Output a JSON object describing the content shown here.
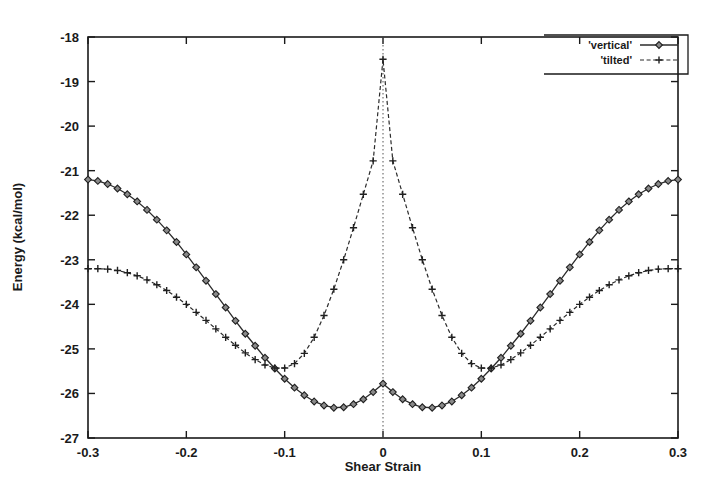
{
  "chart_data": {
    "type": "line",
    "title": "",
    "xlabel": "Shear Strain",
    "ylabel": "Energy (kcal/mol)",
    "xlim": [
      -0.3,
      0.3
    ],
    "ylim": [
      -27,
      -18
    ],
    "xticks": [
      -0.3,
      -0.2,
      -0.1,
      0,
      0.1,
      0.2,
      0.3
    ],
    "xtick_labels": [
      "-0.3",
      "-0.2",
      "-0.1",
      "0",
      "0.1",
      "0.2",
      "0.3"
    ],
    "yticks": [
      -27,
      -26,
      -25,
      -24,
      -23,
      -22,
      -21,
      -20,
      -19,
      -18
    ],
    "ytick_labels": [
      "-27",
      "-26",
      "-25",
      "-24",
      "-23",
      "-22",
      "-21",
      "-20",
      "-19",
      "-18"
    ],
    "grid": false,
    "legend_position": "top-right",
    "annotations": [
      {
        "name": "zero-strain-marker",
        "type": "vline",
        "x": 0,
        "style": "dotted"
      }
    ],
    "series": [
      {
        "name": "'vertical'",
        "marker": "diamond",
        "linestyle": "solid",
        "x": [
          -0.3,
          -0.29,
          -0.28,
          -0.27,
          -0.26,
          -0.25,
          -0.24,
          -0.23,
          -0.22,
          -0.21,
          -0.2,
          -0.19,
          -0.18,
          -0.17,
          -0.16,
          -0.15,
          -0.14,
          -0.13,
          -0.12,
          -0.11,
          -0.1,
          -0.09,
          -0.08,
          -0.07,
          -0.06,
          -0.05,
          -0.04,
          -0.03,
          -0.02,
          -0.01,
          0,
          0.01,
          0.02,
          0.03,
          0.04,
          0.05,
          0.06,
          0.07,
          0.08,
          0.09,
          0.1,
          0.11,
          0.12,
          0.13,
          0.14,
          0.15,
          0.16,
          0.17,
          0.18,
          0.19,
          0.2,
          0.21,
          0.22,
          0.23,
          0.24,
          0.25,
          0.26,
          0.27,
          0.28,
          0.29,
          0.3
        ],
        "y": [
          -21.2,
          -21.23,
          -21.3,
          -21.4,
          -21.53,
          -21.69,
          -21.88,
          -22.1,
          -22.34,
          -22.6,
          -22.88,
          -23.17,
          -23.47,
          -23.77,
          -24.07,
          -24.37,
          -24.66,
          -24.93,
          -25.2,
          -25.44,
          -25.67,
          -25.87,
          -26.04,
          -26.18,
          -26.27,
          -26.32,
          -26.31,
          -26.24,
          -26.13,
          -25.97,
          -25.78,
          -25.97,
          -26.13,
          -26.24,
          -26.31,
          -26.32,
          -26.27,
          -26.18,
          -26.04,
          -25.87,
          -25.67,
          -25.44,
          -25.2,
          -24.93,
          -24.66,
          -24.37,
          -24.07,
          -23.77,
          -23.47,
          -23.17,
          -22.88,
          -22.6,
          -22.34,
          -22.1,
          -21.88,
          -21.69,
          -21.53,
          -21.4,
          -21.3,
          -21.23,
          -21.2
        ]
      },
      {
        "name": "'tilted'",
        "marker": "plus",
        "linestyle": "dashed",
        "x": [
          -0.3,
          -0.29,
          -0.28,
          -0.27,
          -0.26,
          -0.25,
          -0.24,
          -0.23,
          -0.22,
          -0.21,
          -0.2,
          -0.19,
          -0.18,
          -0.17,
          -0.16,
          -0.15,
          -0.14,
          -0.13,
          -0.12,
          -0.11,
          -0.1,
          -0.09,
          -0.08,
          -0.07,
          -0.06,
          -0.05,
          -0.04,
          -0.03,
          -0.02,
          -0.01,
          0,
          0.01,
          0.02,
          0.03,
          0.04,
          0.05,
          0.06,
          0.07,
          0.08,
          0.09,
          0.1,
          0.11,
          0.12,
          0.13,
          0.14,
          0.15,
          0.16,
          0.17,
          0.18,
          0.19,
          0.2,
          0.21,
          0.22,
          0.23,
          0.24,
          0.25,
          0.26,
          0.27,
          0.28,
          0.29,
          0.3
        ],
        "y": [
          -23.2,
          -23.2,
          -23.21,
          -23.24,
          -23.29,
          -23.36,
          -23.45,
          -23.56,
          -23.69,
          -23.84,
          -24.0,
          -24.18,
          -24.36,
          -24.55,
          -24.74,
          -24.92,
          -25.09,
          -25.24,
          -25.36,
          -25.43,
          -25.43,
          -25.33,
          -25.1,
          -24.74,
          -24.25,
          -23.66,
          -23.0,
          -22.28,
          -21.53,
          -20.78,
          -18.5,
          -20.78,
          -21.53,
          -22.28,
          -23.0,
          -23.66,
          -24.25,
          -24.74,
          -25.1,
          -25.33,
          -25.43,
          -25.43,
          -25.36,
          -25.24,
          -25.09,
          -24.92,
          -24.74,
          -24.55,
          -24.36,
          -24.18,
          -24.0,
          -23.84,
          -23.69,
          -23.56,
          -23.45,
          -23.36,
          -23.29,
          -23.24,
          -23.21,
          -23.2,
          -23.2
        ]
      }
    ]
  },
  "legend": {
    "entries": [
      {
        "label": "'vertical'",
        "marker": "diamond",
        "linestyle": "solid"
      },
      {
        "label": "'tilted'",
        "marker": "plus",
        "linestyle": "dashed"
      }
    ]
  }
}
